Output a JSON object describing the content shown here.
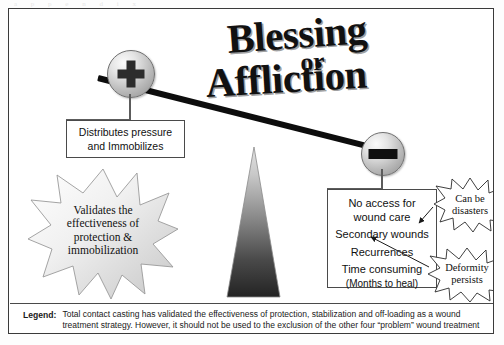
{
  "page": {
    "scan_ghost": "a  p  p  e  n  d  i  x"
  },
  "title": {
    "line1": "Blessing",
    "line2": "or",
    "line3": "Affliction"
  },
  "balance": {
    "positive_icon": "plus-circle-icon",
    "negative_icon": "minus-circle-icon",
    "fulcrum_icon": "triangle-fulcrum-icon"
  },
  "boxes": {
    "benefit": {
      "line1": "Distributes pressure",
      "line2": "and Immobilizes"
    },
    "drawbacks": {
      "line1": "No access for",
      "line2": "wound care",
      "line3": "Secondary wounds",
      "line4": "Recurrences",
      "line5": "Time consuming",
      "line6": "(Months to heal)"
    }
  },
  "bursts": {
    "validates": {
      "line1": "Validates the",
      "line2": "effectiveness of",
      "line3": "protection &",
      "line4": "immobilization"
    },
    "disasters": {
      "line1": "Can be",
      "line2": "disasters"
    },
    "deformity": {
      "line1": "Deformity",
      "line2": "persists"
    }
  },
  "legend": {
    "label": "Legend:",
    "text": "Total contact casting has validated the effectiveness of protection, stabilization and off-loading as a wound treatment strategy.  However, it should not be used to the exclusion of the other four “problem” wound treatment strategies."
  },
  "colors": {
    "border": "#3a3a3a",
    "beam": "#0d0d0d",
    "text": "#111111",
    "fulcrum_top": "#d9d9d9",
    "fulcrum_bottom": "#2b2b2b"
  }
}
